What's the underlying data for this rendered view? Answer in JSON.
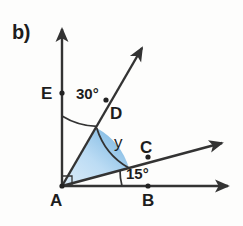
{
  "figure": {
    "part_label": "b)",
    "background_color": "#fdfdfc",
    "stroke_color": "#333333",
    "sector_fill_light": "#d3e6f7",
    "sector_fill_dark": "#6fb0de",
    "points": [
      {
        "name": "A",
        "label": "A",
        "role": "vertex",
        "x": 62,
        "y": 186
      },
      {
        "name": "B",
        "label": "B",
        "role": "on-horizontal-ray",
        "x": 148,
        "y": 186
      },
      {
        "name": "C",
        "label": "C",
        "role": "on-middle-ray",
        "x": 148,
        "y": 157
      },
      {
        "name": "D",
        "label": "D",
        "role": "on-upper-ray",
        "x": 106,
        "y": 100
      },
      {
        "name": "E",
        "label": "E",
        "role": "on-vertical-ray",
        "x": 62,
        "y": 93
      }
    ],
    "rays": [
      {
        "name": "ray-AB-horizontal",
        "from": "A",
        "direction_deg": 0
      },
      {
        "name": "ray-AC-middle",
        "from": "A",
        "direction_deg": 15
      },
      {
        "name": "ray-AD-upper",
        "from": "A",
        "direction_deg": 60
      },
      {
        "name": "ray-AE-vertical",
        "from": "A",
        "direction_deg": 90
      }
    ],
    "angles": [
      {
        "name": "angle-EAD",
        "label": "30°",
        "value": 30,
        "unit": "degrees",
        "between": [
          "E",
          "D"
        ],
        "marked": true
      },
      {
        "name": "angle-DAC",
        "label": "y",
        "value": null,
        "unit": "unknown",
        "between": [
          "D",
          "C"
        ],
        "marked": true,
        "shaded": true
      },
      {
        "name": "angle-CAB",
        "label": "15°",
        "value": 15,
        "unit": "degrees",
        "between": [
          "C",
          "B"
        ],
        "marked": true
      },
      {
        "name": "angle-BAE-right-angle",
        "label": "",
        "value": 90,
        "unit": "degrees",
        "between": [
          "B",
          "E"
        ],
        "marked": true
      }
    ],
    "labels": {
      "part": "b)",
      "point_a": "A",
      "point_b": "B",
      "point_c": "C",
      "point_d": "D",
      "point_e": "E",
      "angle_upper": "30°",
      "angle_lower": "15°",
      "angle_unknown": "y"
    }
  }
}
